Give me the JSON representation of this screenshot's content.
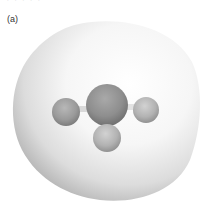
{
  "figure": {
    "panel_label": "(a)",
    "top_cut_text": "· · · · ·",
    "colors": {
      "background": "#ffffff",
      "surface_light": "#f4f4f4",
      "surface_shadow": "#b8b8b8",
      "central_atom": "#8c8c8c",
      "terminal_atom": "#b0b0b0",
      "bond": "#d8d8d8"
    },
    "molecule": {
      "central_atom": {
        "cx": 107,
        "cy": 105,
        "r": 21
      },
      "terminal_atoms": [
        {
          "name": "left",
          "cx": 66,
          "cy": 112,
          "r": 14
        },
        {
          "name": "right",
          "cx": 146,
          "cy": 110,
          "r": 13
        },
        {
          "name": "bottom",
          "cx": 107,
          "cy": 138,
          "r": 14
        }
      ]
    }
  }
}
